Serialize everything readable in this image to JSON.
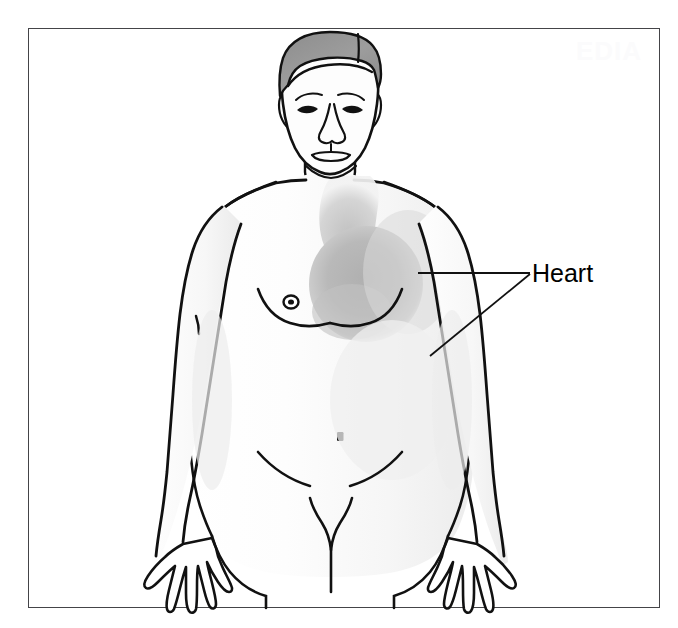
{
  "figure": {
    "watermark": "EDIA",
    "frame": {
      "x": 28,
      "y": 28,
      "width": 632,
      "height": 580,
      "border_color": "#444448",
      "background": "#ffffff"
    }
  },
  "labels": [
    {
      "id": "heart",
      "text": "Heart",
      "x": 532,
      "y": 259,
      "font_size": 25,
      "color": "#000000",
      "leader_lines": [
        {
          "x1": 530,
          "y1": 273,
          "x2": 418,
          "y2": 273,
          "description": "horizontal pointer to shaded heart mass"
        },
        {
          "x1": 530,
          "y1": 274,
          "x2": 430,
          "y2": 356,
          "description": "diagonal pointer to lower left chest"
        }
      ]
    }
  ],
  "regions": [
    {
      "id": "heart-shading",
      "name": "heart",
      "shade_color": "#b8b8b8",
      "description": "soft gray elliptical mass over left chest with great-vessel stem rising toward neck"
    },
    {
      "id": "hair",
      "name": "hair",
      "shade_color": "#9a9a9a",
      "description": "short side-parted gray hair"
    },
    {
      "id": "skin",
      "name": "skin",
      "shade_color": "#fbfbfb",
      "description": "pale outlined skin with light gradient shading"
    }
  ],
  "anatomy_parts": [
    "head",
    "hair",
    "eyes",
    "nose",
    "mouth",
    "ears",
    "neck",
    "shoulders",
    "chest",
    "nipple",
    "arms",
    "hands",
    "navel",
    "abdomen",
    "pelvis",
    "thighs"
  ],
  "colors": {
    "outline": "#111111",
    "heart_shade": "#b8b8b8",
    "hair_shade": "#9a9a9a",
    "skin_fill": "#fcfcfc",
    "frame_border": "#444448",
    "background": "#ffffff",
    "label_text": "#000000"
  }
}
